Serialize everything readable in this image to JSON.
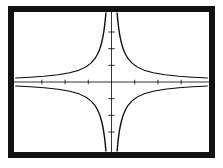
{
  "figure": {
    "title": "",
    "frame_color": "#111111",
    "background_color": "#ffffff",
    "ink_color": "#0d0d0d",
    "caption": ""
  },
  "chart_data": {
    "type": "line",
    "title": "",
    "subtitle": "",
    "xlabel": "",
    "ylabel": "",
    "grid": false,
    "legend": null,
    "legend_position": "none",
    "xlim": [
      -4.2,
      4.2
    ],
    "ylim": [
      -4.2,
      4.2
    ],
    "x_ticks": [
      -3,
      -2,
      -1,
      1,
      2,
      3
    ],
    "y_ticks": [
      -3,
      -2,
      -1,
      1,
      2,
      3
    ],
    "x_tick_labels": [
      "",
      "",
      "",
      "",
      "",
      ""
    ],
    "y_tick_labels": [
      "",
      "",
      "",
      "",
      "",
      ""
    ],
    "asymptotes": {
      "vertical": [
        0
      ],
      "horizontal": [
        0
      ]
    },
    "annotations": [],
    "series": [
      {
        "name": "y = 1/x  (quadrant I)",
        "quadrant": "I",
        "x": [
          0.24,
          0.26,
          0.28,
          0.31,
          0.34,
          0.38,
          0.43,
          0.5,
          0.6,
          0.72,
          0.88,
          1.1,
          1.4,
          1.8,
          2.3,
          2.9,
          3.5,
          4.15
        ],
        "y": [
          4.17,
          3.85,
          3.57,
          3.23,
          2.94,
          2.63,
          2.33,
          2.0,
          1.67,
          1.39,
          1.14,
          0.91,
          0.71,
          0.56,
          0.43,
          0.34,
          0.29,
          0.24
        ]
      },
      {
        "name": "y = -1/x  (quadrant II)",
        "quadrant": "II",
        "x": [
          -0.24,
          -0.26,
          -0.28,
          -0.31,
          -0.34,
          -0.38,
          -0.43,
          -0.5,
          -0.6,
          -0.72,
          -0.88,
          -1.1,
          -1.4,
          -1.8,
          -2.3,
          -2.9,
          -3.5,
          -4.15
        ],
        "y": [
          4.17,
          3.85,
          3.57,
          3.23,
          2.94,
          2.63,
          2.33,
          2.0,
          1.67,
          1.39,
          1.14,
          0.91,
          0.71,
          0.56,
          0.43,
          0.34,
          0.29,
          0.24
        ]
      },
      {
        "name": "y = -1/x  (quadrant III)",
        "quadrant": "III",
        "x": [
          -0.24,
          -0.26,
          -0.28,
          -0.31,
          -0.34,
          -0.38,
          -0.43,
          -0.5,
          -0.6,
          -0.72,
          -0.88,
          -1.1,
          -1.4,
          -1.8,
          -2.3,
          -2.9,
          -3.5,
          -4.15
        ],
        "y": [
          -4.17,
          -3.85,
          -3.57,
          -3.23,
          -2.94,
          -2.63,
          -2.33,
          -2.0,
          -1.67,
          -1.39,
          -1.14,
          -0.91,
          -0.71,
          -0.56,
          -0.43,
          -0.34,
          -0.29,
          -0.24
        ]
      },
      {
        "name": "y = 1/x  (quadrant IV)",
        "quadrant": "IV",
        "x": [
          0.24,
          0.26,
          0.28,
          0.31,
          0.34,
          0.38,
          0.43,
          0.5,
          0.6,
          0.72,
          0.88,
          1.1,
          1.4,
          1.8,
          2.3,
          2.9,
          3.5,
          4.15
        ],
        "y": [
          -4.17,
          -3.85,
          -3.57,
          -3.23,
          -2.94,
          -2.63,
          -2.33,
          -2.0,
          -1.67,
          -1.39,
          -1.14,
          -0.91,
          -0.71,
          -0.56,
          -0.43,
          -0.34,
          -0.29,
          -0.24
        ]
      }
    ]
  }
}
